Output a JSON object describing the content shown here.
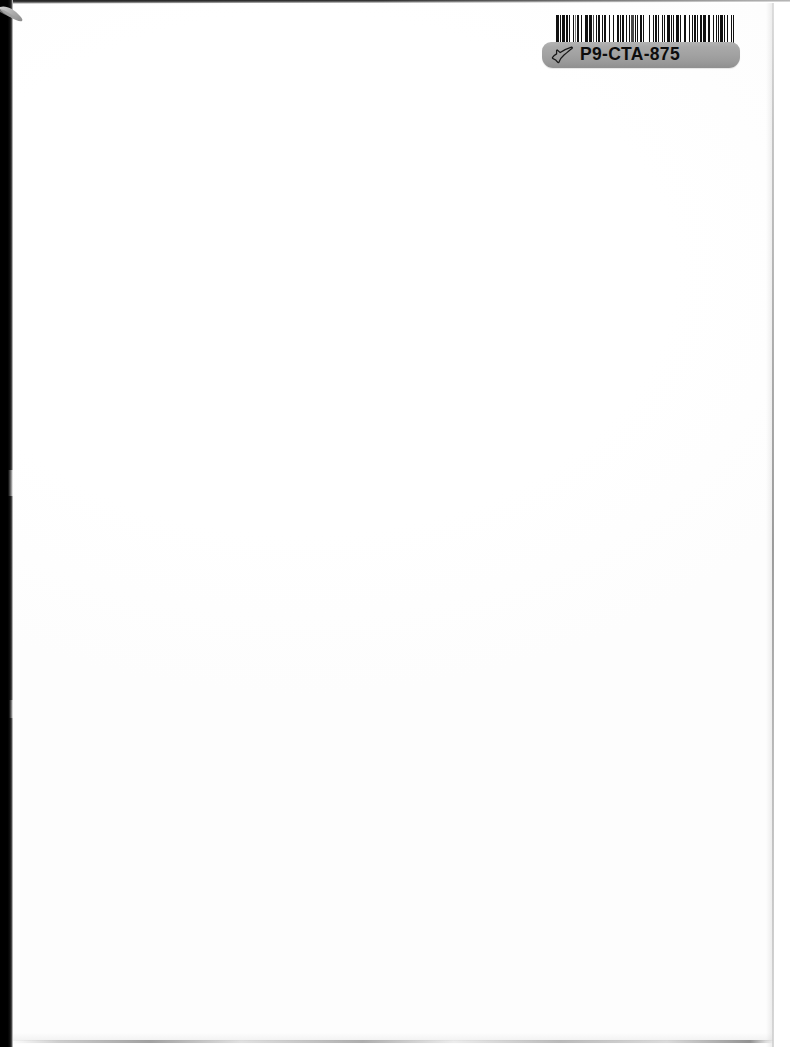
{
  "document": {
    "type": "scanned-blank-page",
    "page_background_color": "#ffffff",
    "body_text": ""
  },
  "scan_artifacts": {
    "left_shadow_color": "#000000",
    "top_shadow_color": "#1d1d1d",
    "right_edge_line_color": "#8c8c8c",
    "bottom_edge_line_color": "#828282",
    "corner_curl_color": "#b9b9b9"
  },
  "asset_tag": {
    "identifier": "P9-CTA-875",
    "label_background_color": "#a2a2a2",
    "label_text_color": "#0d0d0d",
    "icon_name": "pointing-hand-icon",
    "barcode": {
      "symbology": "Code 39",
      "encoded_value": "P9-CTA-875",
      "bar_color": "#111111",
      "background_color": "#ffffff",
      "pattern": [
        3,
        1,
        1,
        2,
        3,
        1,
        2,
        1,
        1,
        3,
        2,
        1,
        1,
        1,
        2,
        2,
        1,
        3,
        1,
        1,
        2,
        1,
        3,
        1,
        1,
        2,
        1,
        1,
        3,
        2,
        1,
        1,
        2,
        3,
        1,
        1,
        1,
        2,
        1,
        3,
        2,
        1,
        1,
        1,
        3,
        2,
        1,
        2,
        1,
        1,
        3,
        1,
        2,
        1,
        1,
        2,
        2,
        1,
        1,
        3,
        1,
        2,
        1,
        3,
        1,
        1,
        2,
        1,
        2,
        3,
        1,
        1,
        1,
        2,
        3,
        1,
        2,
        1,
        1,
        2,
        3,
        1,
        1,
        2,
        1,
        1,
        2,
        3,
        1,
        2,
        1,
        1,
        3,
        1,
        1,
        2,
        2,
        1,
        3,
        1,
        1,
        1,
        2,
        3,
        1,
        2,
        1,
        1,
        2,
        1,
        3,
        1,
        1,
        2,
        1,
        3,
        2,
        1,
        1,
        1
      ],
      "shade_classes": [
        "dark",
        "gap",
        "dark",
        "gap",
        "dark",
        "gap",
        "dark",
        "gap",
        "dark",
        "gap",
        "dark",
        "gap",
        "light",
        "gap",
        "dark",
        "gap",
        "dark",
        "gap",
        "dark",
        "gap",
        "dark",
        "gap",
        "dark",
        "gap",
        "mid",
        "gap",
        "dark",
        "gap",
        "dark",
        "gap",
        "dark",
        "gap",
        "dark",
        "gap",
        "dark",
        "gap",
        "light",
        "gap",
        "dark",
        "gap",
        "dark",
        "gap",
        "dark",
        "gap",
        "dark",
        "gap",
        "dark",
        "gap",
        "dark",
        "gap",
        "mid",
        "gap",
        "dark",
        "gap",
        "dark",
        "gap",
        "dark",
        "gap",
        "dark",
        "gap",
        "dark",
        "gap",
        "dark",
        "gap",
        "dark",
        "gap",
        "dark",
        "gap",
        "dark",
        "gap",
        "dark",
        "gap",
        "dark",
        "gap",
        "dark",
        "gap",
        "dark",
        "gap",
        "dark",
        "gap",
        "dark",
        "gap",
        "dark",
        "gap",
        "dark",
        "gap",
        "dark",
        "gap",
        "dark",
        "gap",
        "dark",
        "gap",
        "dark",
        "gap",
        "dark",
        "gap",
        "dark",
        "gap",
        "dark",
        "gap",
        "dark",
        "gap",
        "dark",
        "gap",
        "dark",
        "gap",
        "dark",
        "gap",
        "dark",
        "gap",
        "dark",
        "gap",
        "dark",
        "gap",
        "dark",
        "gap",
        "dark",
        "gap",
        "dark",
        "gap"
      ]
    }
  }
}
